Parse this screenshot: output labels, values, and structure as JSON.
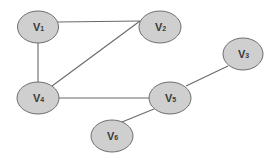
{
  "diagram": {
    "type": "undirected-graph",
    "nodes": [
      {
        "id": "v1",
        "label": "V",
        "sub": "1",
        "cx": 38,
        "cy": 27
      },
      {
        "id": "v2",
        "label": "V",
        "sub": "2",
        "cx": 160,
        "cy": 27
      },
      {
        "id": "v3",
        "label": "V",
        "sub": "3",
        "cx": 243,
        "cy": 54
      },
      {
        "id": "v4",
        "label": "V",
        "sub": "4",
        "cx": 38,
        "cy": 98
      },
      {
        "id": "v5",
        "label": "V",
        "sub": "5",
        "cx": 170,
        "cy": 98
      },
      {
        "id": "v6",
        "label": "V",
        "sub": "6",
        "cx": 112,
        "cy": 136
      }
    ],
    "edges": [
      {
        "from": "v1",
        "to": "v2"
      },
      {
        "from": "v1",
        "to": "v4"
      },
      {
        "from": "v4",
        "to": "v2"
      },
      {
        "from": "v4",
        "to": "v5"
      },
      {
        "from": "v5",
        "to": "v3"
      },
      {
        "from": "v5",
        "to": "v6"
      }
    ],
    "colors": {
      "node_fill": "#cfcfcf",
      "node_stroke": "#6e6e6e",
      "edge": "#6a6a6a",
      "text": "#3a3a3a"
    }
  }
}
